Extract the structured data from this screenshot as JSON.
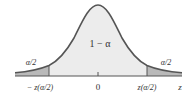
{
  "diagram": {
    "center_area_label": "1 − α",
    "left_tail_label": "α/2",
    "right_tail_label": "α/2",
    "axis": {
      "variable": "z",
      "ticks": [
        {
          "label": "− z(α/2)",
          "position": "left-critical"
        },
        {
          "label": "0",
          "position": "center"
        },
        {
          "label": "z(α/2)",
          "position": "right-critical"
        }
      ]
    },
    "colors": {
      "curve": "#555555",
      "center_fill": "#ececec",
      "tail_fill": "#b9b9b9",
      "baseline": "#555555",
      "text": "#333333"
    }
  }
}
